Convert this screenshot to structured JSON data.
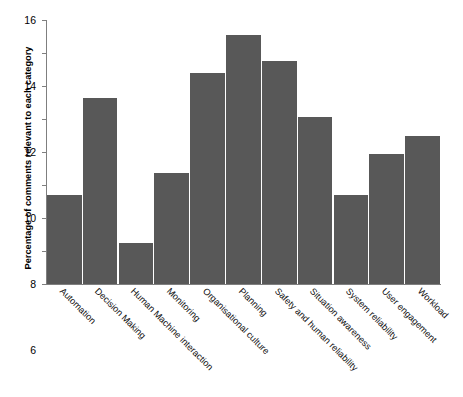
{
  "chart_data": {
    "type": "bar",
    "title": "",
    "xlabel": "",
    "ylabel": "Percentage of comments relevant to each category",
    "ylim": [
      0,
      16
    ],
    "yticks": [
      0,
      2,
      4,
      6,
      8,
      10,
      12,
      14,
      16
    ],
    "grid": false,
    "legend": null,
    "bar_color": "#585858",
    "categories": [
      "Automation",
      "Decision Making",
      "Human Machine interaction",
      "Monitoring",
      "Organisational culture",
      "Planning",
      "Safety and human reliability",
      "Situation awareness",
      "System reliability",
      "User engagement",
      "Workload"
    ],
    "values": [
      5.4,
      11.3,
      2.5,
      6.7,
      12.8,
      15.1,
      13.5,
      10.1,
      5.4,
      7.9,
      9.0
    ]
  }
}
